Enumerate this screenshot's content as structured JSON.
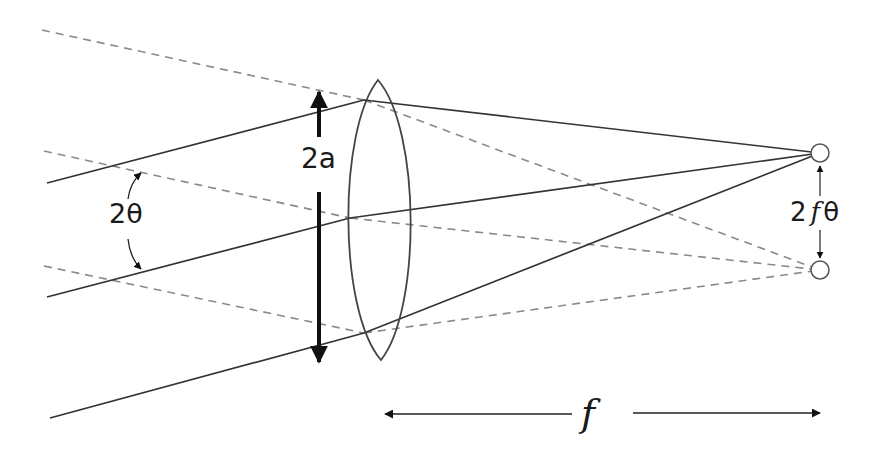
{
  "diagram": {
    "labels": {
      "aperture": "2a",
      "angle": "2θ",
      "image_separation_prefix": "2",
      "image_separation_f": "f",
      "image_separation_suffix": "θ",
      "focal_length": "f"
    },
    "colors": {
      "solid_ray": "#333333",
      "dashed_ray": "#8a8a8a",
      "arrow": "#111111",
      "lens_stroke": "#444444"
    },
    "elements": {
      "lens": {
        "shape": "biconvex",
        "center": [
          380,
          220
        ],
        "half_height": 140,
        "half_width": 30
      },
      "solid_rays": [
        {
          "from": [
            47,
            183
          ],
          "to_lens": [
            364,
            100
          ],
          "focus": [
            820,
            153
          ]
        },
        {
          "from": [
            47,
            297
          ],
          "to_lens": [
            350,
            218
          ],
          "focus": [
            820,
            153
          ]
        },
        {
          "from": [
            50,
            418
          ],
          "to_lens": [
            364,
            333
          ],
          "focus": [
            820,
            153
          ]
        }
      ],
      "dashed_rays": [
        {
          "from": [
            42,
            30
          ],
          "to_lens": [
            364,
            100
          ],
          "focus": [
            820,
            270
          ]
        },
        {
          "from": [
            44,
            151
          ],
          "to_lens": [
            350,
            218
          ],
          "focus": [
            820,
            270
          ]
        },
        {
          "from": [
            44,
            266
          ],
          "to_lens": [
            364,
            333
          ],
          "focus": [
            820,
            270
          ]
        }
      ],
      "image_spots": [
        {
          "center": [
            820,
            153
          ],
          "r": 9
        },
        {
          "center": [
            820,
            270
          ],
          "r": 9
        }
      ]
    }
  }
}
